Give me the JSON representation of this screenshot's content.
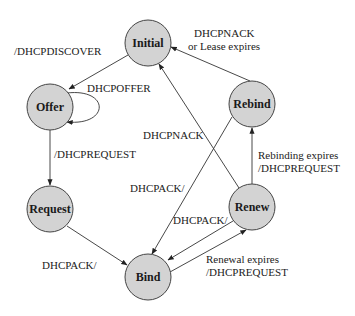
{
  "diagram": {
    "colors": {
      "state_fill": "#d3d3d3",
      "state_stroke": "#444444",
      "edge": "#333333",
      "text": "#222222"
    },
    "states": [
      {
        "id": "initial",
        "label": "Initial",
        "cx": 148,
        "cy": 43
      },
      {
        "id": "offer",
        "label": "Offer",
        "cx": 50,
        "cy": 107
      },
      {
        "id": "request",
        "label": "Request",
        "cx": 50,
        "cy": 209
      },
      {
        "id": "bind",
        "label": "Bind",
        "cx": 148,
        "cy": 277
      },
      {
        "id": "renew",
        "label": "Renew",
        "cx": 252,
        "cy": 207
      },
      {
        "id": "rebind",
        "label": "Rebind",
        "cx": 252,
        "cy": 104
      }
    ],
    "transitions": [
      {
        "from": "initial",
        "to": "offer",
        "label": "/DHCPDISCOVER"
      },
      {
        "from": "offer",
        "to": "offer",
        "label": "DHCPOFFER"
      },
      {
        "from": "offer",
        "to": "request",
        "label": "/DHCPREQUEST"
      },
      {
        "from": "request",
        "to": "bind",
        "label": "DHCPACK/"
      },
      {
        "from": "bind",
        "to": "renew",
        "label_line1": "Renewal expires",
        "label_line2": "/DHCPREQUEST"
      },
      {
        "from": "renew",
        "to": "bind",
        "label": "DHCPACK/"
      },
      {
        "from": "renew",
        "to": "rebind",
        "label_line1": "Rebinding expires",
        "label_line2": "/DHCPREQUEST"
      },
      {
        "from": "rebind",
        "to": "bind",
        "label": "DHCPACK/"
      },
      {
        "from": "renew",
        "to": "initial",
        "label": "DHCPNACK"
      },
      {
        "from": "rebind",
        "to": "initial",
        "label_line1": "DHCPNACK",
        "label_line2": "or Lease expires"
      }
    ]
  }
}
